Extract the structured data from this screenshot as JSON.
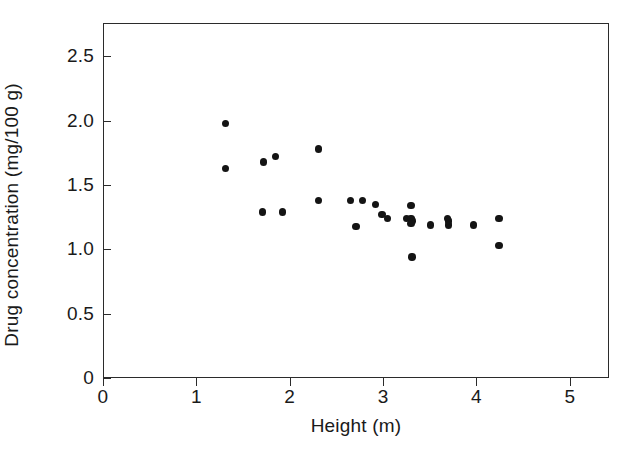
{
  "chart_data": {
    "type": "scatter",
    "title": "",
    "xlabel": "Height (m)",
    "ylabel": "Drug concentration (mg/100 g)",
    "xlim": [
      0,
      5.42
    ],
    "ylim": [
      0,
      2.76
    ],
    "xticks": [
      0,
      1,
      2,
      3,
      4,
      5
    ],
    "xtick_labels": [
      "0",
      "1",
      "2",
      "3",
      "4",
      "5"
    ],
    "yticks": [
      0,
      0.5,
      1.0,
      1.5,
      2.0,
      2.5
    ],
    "ytick_labels": [
      "0",
      "0.5",
      "1.0",
      "1.5",
      "2.0",
      "2.5"
    ],
    "grid": false,
    "legend": false,
    "marker": "filled-circle",
    "marker_color": "#141414",
    "marker_size": 7.4,
    "frame": true,
    "n_points": 27,
    "x": [
      1.31,
      1.31,
      1.71,
      1.72,
      1.85,
      1.92,
      2.31,
      2.31,
      2.65,
      2.78,
      2.71,
      2.92,
      2.99,
      3.05,
      3.25,
      3.25,
      3.3,
      3.3,
      3.31,
      3.51,
      3.69,
      3.7,
      3.73,
      3.97,
      4.24,
      4.24,
      4.3
    ],
    "y": [
      1.98,
      1.63,
      1.29,
      1.68,
      1.72,
      1.29,
      1.78,
      1.38,
      1.38,
      1.38,
      1.18,
      1.35,
      1.27,
      1.24,
      1.24,
      1.22,
      1.34,
      1.24,
      0.94,
      1.19,
      1.24,
      1.19,
      1.21,
      1.19,
      1.24,
      1.03,
      1.24
    ],
    "points": [
      {
        "x": 1.31,
        "y": 1.98
      },
      {
        "x": 1.31,
        "y": 1.63
      },
      {
        "x": 1.71,
        "y": 1.29
      },
      {
        "x": 1.72,
        "y": 1.68
      },
      {
        "x": 1.85,
        "y": 1.72
      },
      {
        "x": 1.92,
        "y": 1.29
      },
      {
        "x": 2.31,
        "y": 1.78
      },
      {
        "x": 2.31,
        "y": 1.38
      },
      {
        "x": 2.65,
        "y": 1.38
      },
      {
        "x": 2.78,
        "y": 1.38
      },
      {
        "x": 2.71,
        "y": 1.18
      },
      {
        "x": 2.92,
        "y": 1.35
      },
      {
        "x": 2.99,
        "y": 1.27
      },
      {
        "x": 3.05,
        "y": 1.24
      },
      {
        "x": 3.25,
        "y": 1.24
      },
      {
        "x": 3.31,
        "y": 1.22
      },
      {
        "x": 3.3,
        "y": 1.34
      },
      {
        "x": 3.3,
        "y": 1.24
      },
      {
        "x": 3.31,
        "y": 0.94
      },
      {
        "x": 3.51,
        "y": 1.19
      },
      {
        "x": 3.69,
        "y": 1.24
      },
      {
        "x": 3.7,
        "y": 1.19
      },
      {
        "x": 3.97,
        "y": 1.19
      },
      {
        "x": 4.24,
        "y": 1.24
      },
      {
        "x": 4.24,
        "y": 1.03
      },
      {
        "x": 3.3,
        "y": 1.2
      },
      {
        "x": 3.7,
        "y": 1.22
      }
    ],
    "colors": {
      "marker": "#141414",
      "axis": "#2b2b2b",
      "background": "#ffffff",
      "text": "#1a1a1a"
    }
  }
}
